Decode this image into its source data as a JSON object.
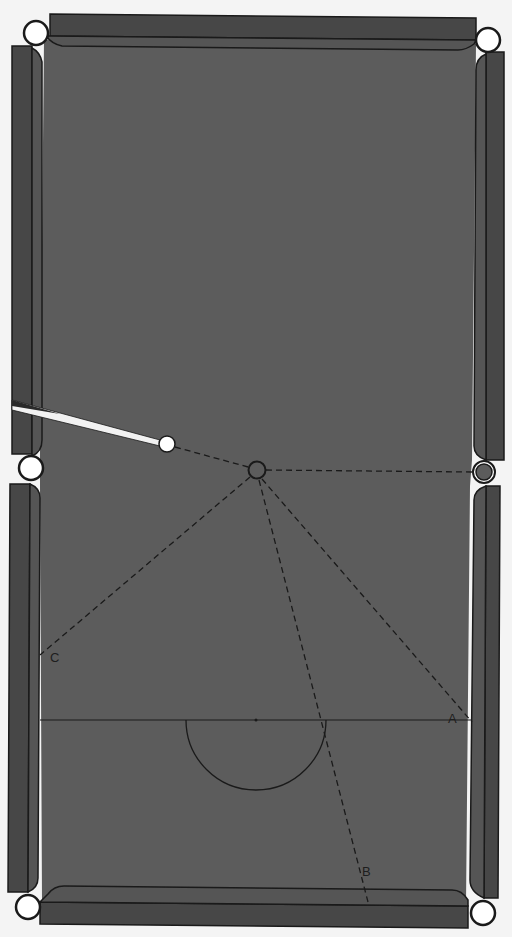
{
  "diagram": {
    "type": "snooker-table-shot-diagram",
    "colors": {
      "background": "#f4f4f4",
      "cloth": "#5c5c5c",
      "rail": "#474747",
      "cushion": "#545454",
      "line": "#1a1a1a",
      "pocket": "#ffffff",
      "cue_ball": "#ffffff",
      "object_ball": "#5c5c5c"
    },
    "labels": {
      "a": "A",
      "b": "B",
      "c": "C"
    },
    "elements": {
      "cue_ball": {
        "x": 167,
        "y": 444
      },
      "object_ball": {
        "x": 257,
        "y": 470
      },
      "middle_pocket_target": {
        "x": 484,
        "y": 472
      },
      "baulk_line_y": 720,
      "d_center": {
        "x": 256,
        "y": 720
      },
      "d_radius": 70
    }
  }
}
